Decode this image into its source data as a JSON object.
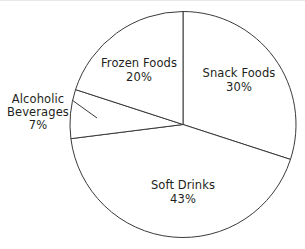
{
  "figure": {
    "title": "",
    "background_color": "#ffffff",
    "outline_color": "#3a3a3a",
    "text_color": "#231f20",
    "width": 305,
    "height": 249
  },
  "chart_data": {
    "type": "pie",
    "title": "",
    "xlabel": "",
    "ylabel": "",
    "legend": "none",
    "grid": false,
    "labels_position": "inside-and-external-leader",
    "start_angle_deg": 0,
    "direction": "clockwise",
    "center": {
      "x": 183,
      "y": 124.5
    },
    "radius": 113,
    "categories": [
      "Snack Foods",
      "Soft Drinks",
      "Alcoholic Beverages",
      "Frozen Foods"
    ],
    "values": [
      30,
      43,
      7,
      20
    ],
    "value_suffix": "%",
    "slices": [
      {
        "name": "Snack Foods",
        "value": 30,
        "value_label": "30%",
        "start_deg": 0,
        "end_deg": 108,
        "fill": "#ffffff",
        "stroke": "#3a3a3a",
        "label_placement": "inside",
        "label_x": 239,
        "label_y": 66
      },
      {
        "name": "Soft Drinks",
        "value": 43,
        "value_label": "43%",
        "start_deg": 108,
        "end_deg": 262.8,
        "fill": "#ffffff",
        "stroke": "#3a3a3a",
        "label_placement": "inside",
        "label_x": 183,
        "label_y": 178
      },
      {
        "name": "Alcoholic Beverages",
        "value": 7,
        "value_label": "7%",
        "start_deg": 262.8,
        "end_deg": 288,
        "fill": "#ffffff",
        "stroke": "#3a3a3a",
        "label_placement": "external",
        "label_x": 38,
        "label_y": 113,
        "leader_line": {
          "x1": 72,
          "y1": 100,
          "x2": 97,
          "y2": 118
        }
      },
      {
        "name": "Frozen Foods",
        "value": 20,
        "value_label": "20%",
        "start_deg": 288,
        "end_deg": 360,
        "fill": "#ffffff",
        "stroke": "#3a3a3a",
        "label_placement": "inside",
        "label_x": 139,
        "label_y": 56
      }
    ]
  },
  "labels": {
    "snack_foods": {
      "name": "Snack Foods",
      "value": "30%"
    },
    "frozen_foods": {
      "name": "Frozen Foods",
      "value": "20%"
    },
    "soft_drinks": {
      "name": "Soft Drinks",
      "value": "43%"
    },
    "alcoholic_beverages": {
      "name_line1": "Alcoholic",
      "name_line2": "Beverages",
      "value": "7%"
    }
  }
}
